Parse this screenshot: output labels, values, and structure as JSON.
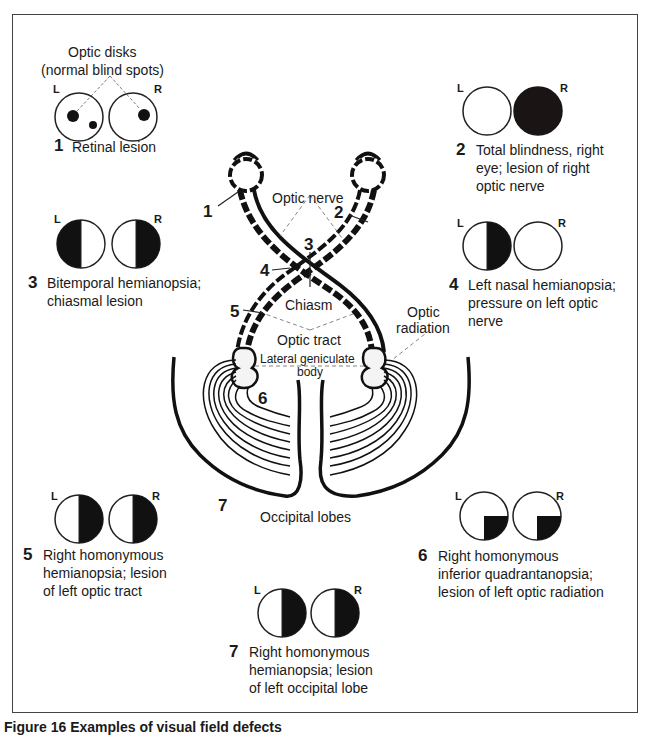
{
  "figure": {
    "caption": "Figure 16 Examples of visual field defects",
    "anatomy_labels": {
      "optic_nerve": "Optic nerve",
      "chiasm": "Chiasm",
      "optic_tract": "Optic tract",
      "lgb_line1": "Lateral geniculate",
      "lgb_line2": "body",
      "optic_radiation_line1": "Optic",
      "optic_radiation_line2": "radiation",
      "occipital_lobes": "Occipital lobes",
      "optic_disks_line1": "Optic disks",
      "optic_disks_line2": "(normal blind spots)"
    },
    "pathway_markers": [
      "1",
      "2",
      "3",
      "4",
      "5",
      "6",
      "7"
    ],
    "eye_labels": {
      "left": "L",
      "right": "R"
    },
    "lesions": [
      {
        "number": "1",
        "lines": [
          "Retinal lesion"
        ],
        "left_field": "blind-spot + scotoma",
        "right_field": "blind-spot"
      },
      {
        "number": "2",
        "lines": [
          "Total blindness, right",
          "eye; lesion of right",
          "optic nerve"
        ],
        "left_field": "normal",
        "right_field": "full-black"
      },
      {
        "number": "3",
        "lines": [
          "Bitemporal hemianopsia;",
          "chiasmal lesion"
        ],
        "left_field": "left-half-black",
        "right_field": "right-half-black"
      },
      {
        "number": "4",
        "lines": [
          "Left nasal hemianopsia;",
          "pressure on left optic",
          "nerve"
        ],
        "left_field": "right-half-black",
        "right_field": "normal"
      },
      {
        "number": "5",
        "lines": [
          "Right homonymous",
          "hemianopsia; lesion",
          "of left optic tract"
        ],
        "left_field": "right-half-black",
        "right_field": "right-half-black"
      },
      {
        "number": "6",
        "lines": [
          "Right homonymous",
          "inferior quadrantanopsia;",
          "lesion of left optic radiation"
        ],
        "left_field": "lower-right-quadrant-black",
        "right_field": "lower-right-quadrant-black"
      },
      {
        "number": "7",
        "lines": [
          "Right homonymous",
          "hemianopsia; lesion",
          "of left occipital lobe"
        ],
        "left_field": "right-half-black",
        "right_field": "right-half-black"
      }
    ]
  }
}
